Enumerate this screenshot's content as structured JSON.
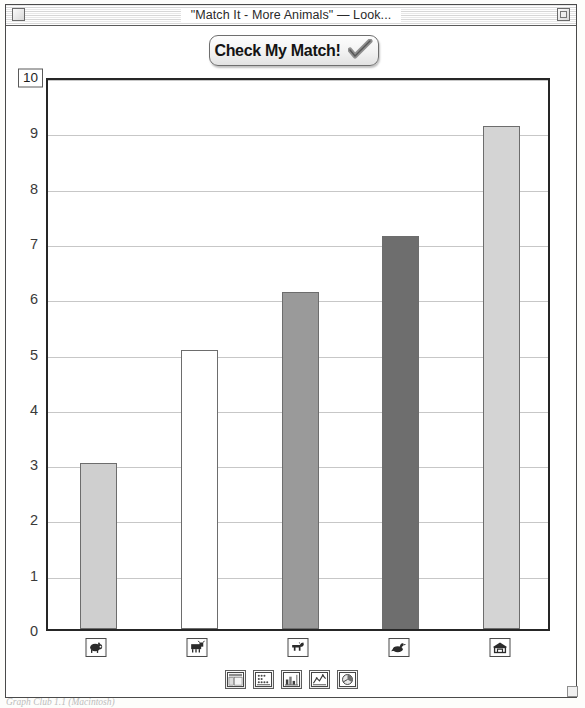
{
  "window": {
    "title": "\"Match It - More Animals\" — Look...",
    "close_icon": "close-box-icon",
    "zoom_icon": "zoom-box-icon"
  },
  "toolbar": {
    "check_button_label": "Check My Match!",
    "check_button_icon": "checkmark-icon"
  },
  "axis": {
    "y_max_value": "10",
    "y_ticks": [
      "9",
      "8",
      "7",
      "6",
      "5",
      "4",
      "3",
      "2",
      "1",
      "0"
    ]
  },
  "chart_types": [
    {
      "name": "table-view-icon",
      "label": "Table"
    },
    {
      "name": "picture-graph-icon",
      "label": "Picture Graph"
    },
    {
      "name": "bar-graph-icon",
      "label": "Bar Graph"
    },
    {
      "name": "line-graph-icon",
      "label": "Line Graph"
    },
    {
      "name": "circle-graph-icon",
      "label": "Circle Graph"
    }
  ],
  "category_buttons": [
    {
      "name": "animal-icon-pig",
      "icon": "pig-icon"
    },
    {
      "name": "animal-icon-cow",
      "icon": "cow-icon"
    },
    {
      "name": "animal-icon-horse",
      "icon": "horse-icon"
    },
    {
      "name": "animal-icon-duck",
      "icon": "duck-icon"
    },
    {
      "name": "animal-icon-barn",
      "icon": "barn-icon"
    }
  ],
  "caption": "Graph Club 1.1 (Macintosh)",
  "colors": {
    "bar1": "#cfcfcf",
    "bar2": "#ffffff",
    "bar3": "#9a9a9a",
    "bar4": "#6e6e6e",
    "bar5": "#d4d4d4",
    "bar_border": "#6d6d6d",
    "grid": "#c7c7c7",
    "frame": "#262626"
  },
  "chart_data": {
    "type": "bar",
    "title": "\"Match It - More Animals\"",
    "xlabel": "",
    "ylabel": "",
    "ylim": [
      0,
      10
    ],
    "grid": true,
    "legend": "none",
    "categories": [
      "pig",
      "cow",
      "horse",
      "duck",
      "barn"
    ],
    "values": [
      3.0,
      5.05,
      6.1,
      7.1,
      9.1
    ],
    "bar_colors": [
      "#cfcfcf",
      "#ffffff",
      "#9a9a9a",
      "#6e6e6e",
      "#d4d4d4"
    ],
    "tick_labels": [
      "0",
      "1",
      "2",
      "3",
      "4",
      "5",
      "6",
      "7",
      "8",
      "9",
      "10"
    ]
  }
}
